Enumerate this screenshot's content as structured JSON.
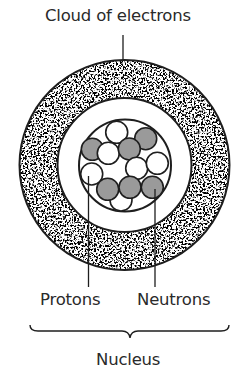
{
  "diagram": {
    "title_label": "Cloud of electrons",
    "labels": {
      "cloud": "Cloud of electrons",
      "protons": "Protons",
      "neutrons": "Neutrons",
      "nucleus": "Nucleus"
    },
    "colors": {
      "stroke": "#1e1e1e",
      "proton_fill": "#ffffff",
      "neutron_fill": "#9a9a9a",
      "cloud_speckle": "#2b2b2b",
      "text": "#2a2a2a"
    },
    "structure": {
      "atom_center": [
        124.5,
        165
      ],
      "electron_cloud_outer_radius": 105,
      "electron_cloud_inner_radius": 67,
      "nucleus_radius": 46
    },
    "particles": [
      {
        "type": "proton",
        "cx": 116.7,
        "cy": 132.3
      },
      {
        "type": "neutron",
        "cx": 145.7,
        "cy": 138.7
      },
      {
        "type": "neutron",
        "cx": 92.3,
        "cy": 149.3
      },
      {
        "type": "proton",
        "cx": 108.3,
        "cy": 153.3
      },
      {
        "type": "neutron",
        "cx": 129.3,
        "cy": 149.0
      },
      {
        "type": "proton",
        "cx": 136.7,
        "cy": 168.3
      },
      {
        "type": "proton",
        "cx": 157.3,
        "cy": 163.3
      },
      {
        "type": "proton",
        "cx": 91.7,
        "cy": 174.0
      },
      {
        "type": "proton",
        "cx": 121.0,
        "cy": 200.0
      },
      {
        "type": "neutron",
        "cx": 107.7,
        "cy": 189.3
      },
      {
        "type": "neutron",
        "cx": 130.0,
        "cy": 187.3
      },
      {
        "type": "neutron",
        "cx": 152.3,
        "cy": 187.3
      }
    ],
    "particle_radius": 11,
    "counts": {
      "protons": 6,
      "neutrons": 6
    }
  }
}
